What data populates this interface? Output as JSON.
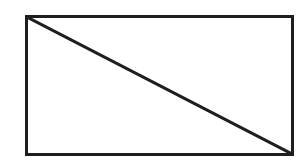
{
  "diagram": {
    "type": "geometric-figure",
    "shapes": [
      {
        "kind": "rectangle",
        "x": 26.5,
        "y": 16.5,
        "width": 266,
        "height": 138,
        "stroke": "#1e1e1e",
        "stroke_width": 3,
        "fill": "none"
      },
      {
        "kind": "line",
        "from": [
          27,
          17
        ],
        "to": [
          292,
          154
        ],
        "label": "diagonal",
        "stroke": "#1e1e1e",
        "stroke_width": 3
      }
    ],
    "colors": {
      "background": "#ffffff",
      "stroke": "#1e1e1e"
    }
  }
}
